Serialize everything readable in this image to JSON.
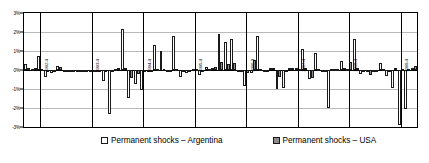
{
  "chart_data": {
    "type": "bar",
    "title": "",
    "xlabel": "",
    "ylabel": "",
    "ylim": [
      -3,
      3
    ],
    "ytick_labels": [
      "3%",
      "2%",
      "1%",
      "0%",
      "-1%",
      "-2%",
      "-3%"
    ],
    "ytick_values": [
      3,
      2,
      1,
      0,
      -1,
      -2,
      -3
    ],
    "grid": true,
    "legend_position": "bottom",
    "x_tick_labels": [
      {
        "index": 2,
        "label": "1992-4"
      },
      {
        "index": 10,
        "label": "1993-4"
      },
      {
        "index": 18,
        "label": "1994-4"
      },
      {
        "index": 26,
        "label": "1995-4"
      },
      {
        "index": 34,
        "label": "1996-4"
      },
      {
        "index": 42,
        "label": "1997-4"
      },
      {
        "index": 50,
        "label": "1998-4"
      },
      {
        "index": 58,
        "label": "1999-4"
      },
      {
        "index": 66,
        "label": "2000"
      },
      {
        "index": 74,
        "label": "2001-4"
      }
    ],
    "series": [
      {
        "name": "Permanent shocks – Argentina",
        "color": "#ffffff",
        "values": [
          0.3,
          0.05,
          0.75,
          -0.38,
          -0.15,
          0.22,
          -0.1,
          -0.08,
          -0.05,
          -0.1,
          -0.05,
          -0.12,
          -0.6,
          -2.3,
          0.05,
          2.15,
          -1.45,
          -0.75,
          -1.05,
          -0.1,
          1.3,
          0.98,
          -0.05,
          1.8,
          -0.38,
          -0.15,
          0.05,
          -0.28,
          0.18,
          0.08,
          1.9,
          1.45,
          1.65,
          -0.05,
          -0.85,
          -0.18,
          1.8,
          -0.1,
          0.12,
          -1.0,
          -0.95,
          0.1,
          0.12,
          1.1,
          -0.45,
          0.88,
          -0.1,
          -2.0,
          0.05,
          0.45,
          0.05,
          1.65,
          -0.2,
          -0.08,
          -0.05,
          0.35,
          -0.3,
          -0.95,
          -2.9,
          -2.05,
          0.08
        ]
      },
      {
        "name": "Permanent shocks – USA",
        "color": "#8c8c8c",
        "values": [
          0.08,
          0.1,
          0.05,
          -0.12,
          -0.08,
          0.15,
          -0.05,
          -0.04,
          -0.1,
          -0.05,
          -0.08,
          -0.06,
          -0.04,
          -0.05,
          0.1,
          0.08,
          -0.4,
          -0.2,
          -0.05,
          -0.08,
          0.05,
          0.04,
          -0.06,
          0.05,
          -0.1,
          -0.05,
          0.05,
          -0.08,
          0.06,
          0.15,
          0.42,
          0.3,
          0.38,
          -0.05,
          -0.18,
          0.55,
          0.06,
          -0.06,
          0.1,
          -0.35,
          -0.08,
          0.1,
          0.05,
          0.08,
          -0.42,
          0.05,
          -0.06,
          0.05,
          0.04,
          0.1,
          0.42,
          0.08,
          -0.05,
          -0.28,
          -0.06,
          0.05,
          -0.12,
          0.08,
          0.06,
          0.05,
          0.2
        ]
      }
    ]
  }
}
